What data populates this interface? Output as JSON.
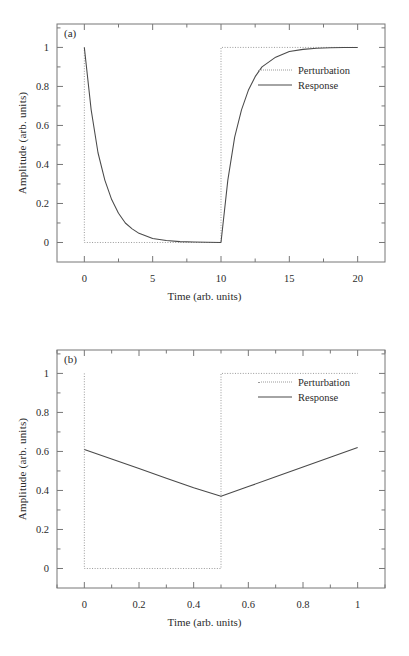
{
  "figure": {
    "panels": [
      {
        "id": "a",
        "label": "(a)",
        "xlabel": "Time (arb. units)",
        "ylabel": "Amplitude (arb. units)",
        "xticks": [
          "0",
          "5",
          "10",
          "15",
          "20"
        ],
        "xtick_values": [
          0,
          5,
          10,
          15,
          20
        ],
        "yticks": [
          "0",
          "0.2",
          "0.4",
          "0.6",
          "0.8",
          "1"
        ],
        "ytick_values": [
          0,
          0.2,
          0.4,
          0.6,
          0.8,
          1
        ],
        "xlim": [
          -2,
          22
        ],
        "ylim": [
          -0.1,
          1.12
        ],
        "legend": [
          {
            "name": "perturbation",
            "label": "Perturbation",
            "style": "dotted",
            "color": "#9a9a9a"
          },
          {
            "name": "response",
            "label": "Response",
            "style": "solid",
            "color": "#4a4a4a"
          }
        ]
      },
      {
        "id": "b",
        "label": "(b)",
        "xlabel": "Time (arb. units)",
        "ylabel": "Amplitude (arb. units)",
        "xticks": [
          "0",
          "0.2",
          "0.4",
          "0.6",
          "0.8",
          "1"
        ],
        "xtick_values": [
          0,
          0.2,
          0.4,
          0.6,
          0.8,
          1
        ],
        "yticks": [
          "0",
          "0.2",
          "0.4",
          "0.6",
          "0.8",
          "1"
        ],
        "ytick_values": [
          0,
          0.2,
          0.4,
          0.6,
          0.8,
          1
        ],
        "xlim": [
          -0.1,
          1.1
        ],
        "ylim": [
          -0.1,
          1.12
        ],
        "legend": [
          {
            "name": "perturbation",
            "label": "Perturbation",
            "style": "dotted",
            "color": "#9a9a9a"
          },
          {
            "name": "response",
            "label": "Response",
            "style": "solid",
            "color": "#4a4a4a"
          }
        ]
      }
    ]
  },
  "chart_data": [
    {
      "type": "line",
      "panel": "a",
      "title": "(a)",
      "xlabel": "Time (arb. units)",
      "ylabel": "Amplitude (arb. units)",
      "xlim": [
        -2,
        22
      ],
      "ylim": [
        -0.1,
        1.12
      ],
      "xticks": [
        0,
        5,
        10,
        15,
        20
      ],
      "yticks": [
        0,
        0.2,
        0.4,
        0.6,
        0.8,
        1
      ],
      "grid": false,
      "legend_position": "upper-right",
      "series": [
        {
          "name": "Perturbation",
          "style": "dotted",
          "color": "#9a9a9a",
          "comment": "square step: 1 at t=0 falling to 0 for 0<t<10, rising to 1 for 10<t<=20",
          "x": [
            0,
            0,
            10,
            10,
            20
          ],
          "values": [
            1,
            0,
            0,
            1,
            1
          ]
        },
        {
          "name": "Response",
          "style": "solid",
          "color": "#4a4a4a",
          "comment": "exponential relaxation, tau = 1.3; decay exp(-t/tau) for 0<=t<=10 then 1-exp(-(t-10)/tau)",
          "x": [
            0,
            0.5,
            1,
            1.5,
            2,
            2.5,
            3,
            3.5,
            4,
            5,
            6,
            7,
            8,
            9,
            10,
            10.5,
            11,
            11.5,
            12,
            12.5,
            13,
            14,
            15,
            16,
            17,
            18,
            19,
            20
          ],
          "values": [
            1.0,
            0.68,
            0.46,
            0.32,
            0.22,
            0.15,
            0.1,
            0.07,
            0.047,
            0.021,
            0.0097,
            0.0044,
            0.002,
            0.0009,
            0.0004,
            0.32,
            0.54,
            0.68,
            0.78,
            0.85,
            0.9,
            0.95,
            0.979,
            0.99,
            0.996,
            0.998,
            0.999,
            1.0
          ]
        }
      ]
    },
    {
      "type": "line",
      "panel": "b",
      "title": "(b)",
      "xlabel": "Time (arb. units)",
      "ylabel": "Amplitude (arb. units)",
      "xlim": [
        -0.1,
        1.1
      ],
      "ylim": [
        -0.1,
        1.12
      ],
      "xticks": [
        0,
        0.2,
        0.4,
        0.6,
        0.8,
        1
      ],
      "yticks": [
        0,
        0.2,
        0.4,
        0.6,
        0.8,
        1
      ],
      "grid": false,
      "legend_position": "upper-right",
      "series": [
        {
          "name": "Perturbation",
          "style": "dotted",
          "color": "#9a9a9a",
          "comment": "square step: 1 at t=0 falling to 0 for 0<t<0.5, rising to 1 for 0.5<t<=1",
          "x": [
            0,
            0,
            0.5,
            0.5,
            1
          ],
          "values": [
            1,
            0,
            0,
            1,
            1
          ]
        },
        {
          "name": "Response",
          "style": "solid",
          "color": "#4a4a4a",
          "comment": "slow relaxation limit: near-linear V shape, minimum at t=0.5",
          "x": [
            0,
            0.1,
            0.2,
            0.3,
            0.4,
            0.5,
            0.6,
            0.7,
            0.8,
            0.9,
            1.0
          ],
          "values": [
            0.61,
            0.561,
            0.512,
            0.463,
            0.414,
            0.37,
            0.42,
            0.47,
            0.52,
            0.57,
            0.62
          ]
        }
      ]
    }
  ]
}
